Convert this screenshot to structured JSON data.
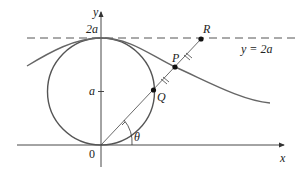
{
  "diagram": {
    "axes": {
      "x_label": "x",
      "y_label": "y",
      "origin_label": "0"
    },
    "y_ticks": [
      {
        "label": "a"
      },
      {
        "label": "2a"
      }
    ],
    "horizontal_line_label": "y = 2a",
    "points": [
      {
        "name": "R"
      },
      {
        "name": "P"
      },
      {
        "name": "Q"
      }
    ],
    "angle_label": "θ",
    "colors": {
      "curve": "#555555",
      "axis": "#333333",
      "point": "#111111",
      "dashed": "#555555"
    }
  }
}
